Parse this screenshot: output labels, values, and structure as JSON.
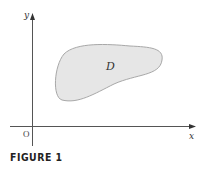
{
  "figure": {
    "caption": "FIGURE 1",
    "axes": {
      "x_label": "x",
      "y_label": "y",
      "origin_label": "O"
    },
    "region": {
      "label": "D",
      "fill_color": "#e6e6e6",
      "stroke_color": "#a8a8a8"
    },
    "colors": {
      "axis": "#555555",
      "background": "#ffffff"
    }
  }
}
